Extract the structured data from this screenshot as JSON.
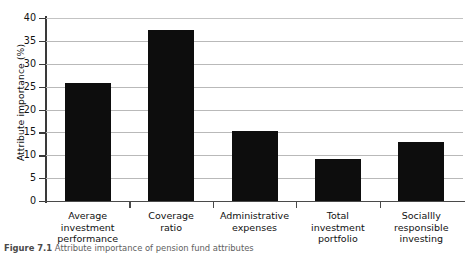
{
  "chart_data": {
    "type": "bar",
    "title": "",
    "xlabel": "",
    "ylabel": "Attribute importance (%)",
    "ylim": [
      0,
      40
    ],
    "ytick_step": 5,
    "yticks": [
      "40",
      "35",
      "30",
      "25",
      "20",
      "15",
      "10",
      "5",
      "0"
    ],
    "grid": "horizontal",
    "legend": "none",
    "bar_color": "#0d0d0d",
    "categories": [
      "Average investment performance",
      "Coverage ratio",
      "Administrative expenses",
      "Total investment portfolio",
      "Sociallly responsible investing"
    ],
    "category_lines": [
      [
        "Average",
        "investment",
        "performance"
      ],
      [
        "Coverage",
        "ratio"
      ],
      [
        "Administrative",
        "expenses"
      ],
      [
        "Total",
        "investment",
        "portfolio"
      ],
      [
        "Sociallly",
        "responsible",
        "investing"
      ]
    ],
    "values": [
      25.7,
      37.4,
      15.3,
      9.2,
      13.0
    ]
  },
  "caption": {
    "label": "Figure 7.1",
    "text": "Attribute importance of pension fund attributes"
  }
}
